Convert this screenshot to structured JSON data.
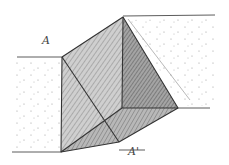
{
  "diagram": {
    "type": "pencil-sketch",
    "labels": {
      "top": "A",
      "bottom": "A'"
    },
    "colors": {
      "background": "#ffffff",
      "stroke": "#3a3a3a",
      "shade_light": "#b8b8b8",
      "shade_dark": "#7a7a7a",
      "stipple": "#9a9a9a"
    }
  }
}
